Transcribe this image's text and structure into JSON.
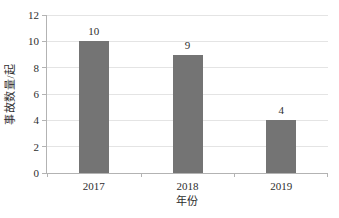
{
  "chart_data": {
    "type": "bar",
    "title": "",
    "categories": [
      "2017",
      "2018",
      "2019"
    ],
    "values": [
      10,
      9,
      4
    ],
    "data_labels": [
      "10",
      "9",
      "4"
    ],
    "xlabel": "年份",
    "ylabel": "事故数量/起",
    "ylim": [
      0,
      12
    ],
    "yticks": [
      0,
      2,
      4,
      6,
      8,
      10,
      12
    ],
    "grid": "horizontal",
    "legend": "none",
    "colors": {
      "bar": "#747474",
      "axis": "#b3b3b3",
      "gridline": "#e4e4e4",
      "text": "#2e2e2e",
      "background": "#ffffff"
    }
  }
}
